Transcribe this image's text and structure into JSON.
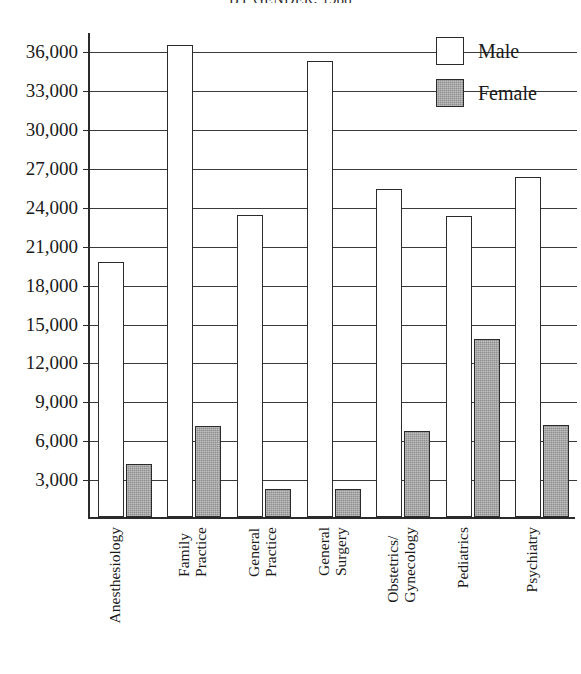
{
  "chart_data": {
    "type": "bar",
    "title": "BY GENDER, 1988",
    "xlabel": "",
    "ylabel": "",
    "categories": [
      "Anesthesiology",
      "Family\nPractice",
      "General\nPractice",
      "General\nSurgery",
      "Obstetrics/\nGynecology",
      "Pediatrics",
      "Psychiatry"
    ],
    "series": [
      {
        "name": "Male",
        "color": "#ffffff",
        "values": [
          19700,
          36400,
          23300,
          35200,
          25300,
          23200,
          26200
        ]
      },
      {
        "name": "Female",
        "color": "#8f8f8f",
        "values": [
          4100,
          7000,
          2200,
          2200,
          6600,
          13700,
          7100
        ]
      }
    ],
    "ylim": [
      0,
      37500
    ],
    "yticks": [
      3000,
      6000,
      9000,
      12000,
      15000,
      18000,
      21000,
      24000,
      27000,
      30000,
      33000,
      36000
    ],
    "ytick_labels": [
      "3,000",
      "6,000",
      "9,000",
      "12,000",
      "15,000",
      "18,000",
      "21,000",
      "24,000",
      "27,000",
      "30,000",
      "33,000",
      "36,000"
    ],
    "grid": true,
    "legend_position": "top-right",
    "legend": [
      {
        "label": "Male",
        "swatch": "male"
      },
      {
        "label": "Female",
        "swatch": "female"
      }
    ]
  }
}
